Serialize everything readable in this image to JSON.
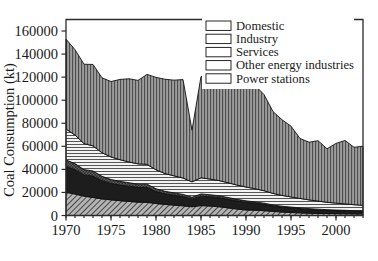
{
  "chart_data": {
    "type": "area",
    "stacked": true,
    "title": "",
    "xlabel": "",
    "ylabel": "Coal Consumption (kt)",
    "xlim": [
      1970,
      2003
    ],
    "ylim": [
      0,
      170000
    ],
    "ytick_values": [
      0,
      20000,
      40000,
      60000,
      80000,
      100000,
      120000,
      140000,
      160000
    ],
    "ytick_labels": [
      "0",
      "20000",
      "40000",
      "60000",
      "80000",
      "100000",
      "120000",
      "140000",
      "160000"
    ],
    "xtick_values": [
      1970,
      1975,
      1980,
      1985,
      1990,
      1995,
      2000
    ],
    "xtick_labels": [
      "1970",
      "1975",
      "1980",
      "1985",
      "1990",
      "1995",
      "2000"
    ],
    "x_minor_step": 1,
    "grid": false,
    "legend_position": "top-right",
    "x": [
      1970,
      1971,
      1972,
      1973,
      1974,
      1975,
      1976,
      1977,
      1978,
      1979,
      1980,
      1981,
      1982,
      1983,
      1984,
      1985,
      1986,
      1987,
      1988,
      1989,
      1990,
      1991,
      1992,
      1993,
      1994,
      1995,
      1996,
      1997,
      1998,
      1999,
      2000,
      2001,
      2002,
      2003
    ],
    "series": [
      {
        "name": "Domestic",
        "pattern": "diagonal-hatch",
        "color": "#8c8c8c",
        "values": [
          20200,
          18600,
          16800,
          15600,
          14400,
          13600,
          12800,
          12200,
          11600,
          11400,
          10400,
          9600,
          9000,
          8400,
          7600,
          8600,
          8200,
          7600,
          6600,
          5600,
          4800,
          4600,
          4200,
          3600,
          3000,
          2600,
          2300,
          2000,
          1800,
          1700,
          1600,
          1500,
          1400,
          1300
        ]
      },
      {
        "name": "Industry",
        "pattern": "solid-dark",
        "color": "#1d1d1d",
        "values": [
          22400,
          21200,
          18400,
          18600,
          15800,
          14200,
          13600,
          13200,
          12800,
          13000,
          10400,
          9200,
          8600,
          8000,
          6600,
          8200,
          8000,
          7800,
          7400,
          7000,
          6600,
          6000,
          5400,
          4600,
          4200,
          3900,
          3600,
          3300,
          3100,
          2800,
          2600,
          2500,
          2300,
          2200
        ]
      },
      {
        "name": "Services",
        "pattern": "dark-check",
        "color": "#3a3a3a",
        "values": [
          5600,
          5200,
          4600,
          4400,
          3800,
          3400,
          3200,
          3000,
          2800,
          2800,
          2400,
          2200,
          2000,
          1900,
          1600,
          1900,
          1800,
          1700,
          1600,
          1400,
          1300,
          1200,
          1100,
          950,
          850,
          780,
          700,
          650,
          600,
          560,
          520,
          500,
          470,
          450
        ]
      },
      {
        "name": "Other energy industries",
        "pattern": "horizontal-lines",
        "color": "#e0e0e0",
        "values": [
          26800,
          24800,
          22600,
          21800,
          20400,
          19600,
          18800,
          18000,
          17600,
          17200,
          16400,
          15400,
          14800,
          14200,
          13400,
          14000,
          13600,
          13200,
          12800,
          12400,
          12000,
          11400,
          10800,
          10000,
          9400,
          8800,
          8200,
          7600,
          7000,
          6400,
          6000,
          5600,
          5200,
          4900
        ]
      },
      {
        "name": "Power stations",
        "pattern": "vertical-lines",
        "color": "#9a9a9a",
        "values": [
          78000,
          74000,
          68800,
          70600,
          65000,
          65400,
          69600,
          72200,
          72400,
          78000,
          80200,
          81800,
          83000,
          85400,
          44800,
          87800,
          92000,
          93400,
          95200,
          94000,
          97000,
          89600,
          83400,
          71000,
          65600,
          61400,
          52000,
          50000,
          52400,
          46400,
          51800,
          55000,
          49800,
          51200
        ]
      }
    ],
    "totals_note": "Stacked totals peak ~153000 kt in 1970 and fall to ~60000 kt by 2003, with a sharp trough in 1984."
  },
  "legend": {
    "items": [
      {
        "label": "Domestic",
        "swatch": "diagonal-hatch-swatch"
      },
      {
        "label": "Industry",
        "swatch": "solid-dark-swatch"
      },
      {
        "label": "Services",
        "swatch": "dark-check-swatch"
      },
      {
        "label": "Other energy industries",
        "swatch": "horizontal-lines-swatch"
      },
      {
        "label": "Power stations",
        "swatch": "vertical-lines-swatch"
      }
    ]
  },
  "axes": {
    "y_title": "Coal Consumption (kt)"
  }
}
